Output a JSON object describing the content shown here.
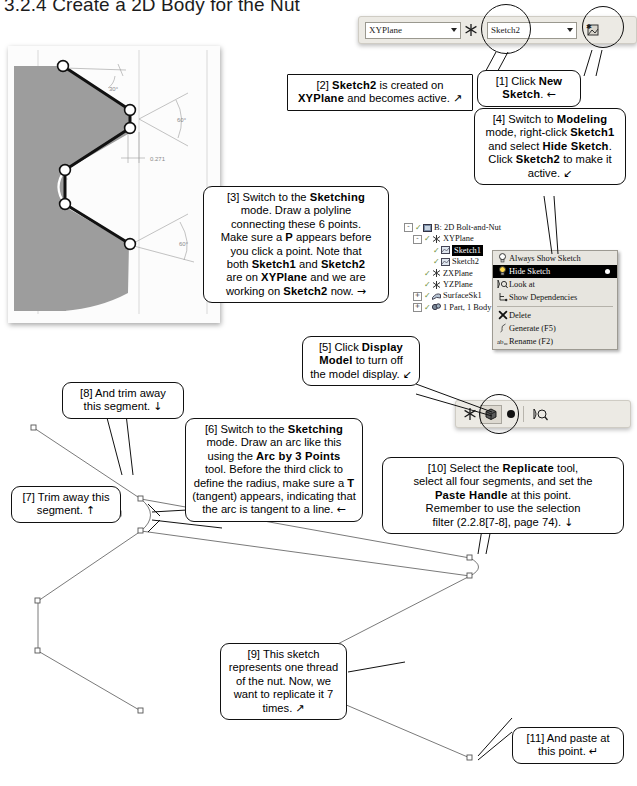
{
  "page": {
    "title": "3.2.4  Create a 2D Body for the Nut"
  },
  "toolbar_top": {
    "plane_value": "XYPlane",
    "plane_icon": "plane-axis-icon",
    "sketch_value": "Sketch2",
    "new_sketch_icon": "new-sketch-icon"
  },
  "toolbar_display": {
    "axis_icon": "plane-axis-icon",
    "display_model_icon": "display-model-icon",
    "look_at_icon": "look-at-icon"
  },
  "tree": {
    "items": [
      {
        "label": "B: 2D Bolt-and-Nut",
        "indent": 0,
        "expander": "-",
        "icon": "assembly-icon",
        "selected": false
      },
      {
        "label": "XYPlane",
        "indent": 1,
        "expander": "-",
        "icon": "plane-icon",
        "selected": false
      },
      {
        "label": "Sketch1",
        "indent": 2,
        "expander": "",
        "icon": "sketch-icon",
        "selected": true
      },
      {
        "label": "Sketch2",
        "indent": 2,
        "expander": "",
        "icon": "sketch-icon",
        "selected": false
      },
      {
        "label": "ZXPlane",
        "indent": 1,
        "expander": "",
        "icon": "plane-icon",
        "selected": false
      },
      {
        "label": "YZPlane",
        "indent": 1,
        "expander": "",
        "icon": "plane-icon",
        "selected": false
      },
      {
        "label": "SurfaceSk1",
        "indent": 1,
        "expander": "+",
        "icon": "surface-icon",
        "selected": false
      },
      {
        "label": "1 Part, 1 Body",
        "indent": 1,
        "expander": "+",
        "icon": "body-icon",
        "selected": false
      }
    ]
  },
  "context_menu": {
    "items": [
      {
        "label": "Always Show Sketch",
        "icon": "bulb-off-icon",
        "highlighted": false,
        "radio": false
      },
      {
        "label": "Hide Sketch",
        "icon": "bulb-on-icon",
        "highlighted": true,
        "radio": true
      },
      {
        "label": "Look at",
        "icon": "look-at-icon",
        "highlighted": false,
        "radio": false
      },
      {
        "label": "Show Dependencies",
        "icon": "dependencies-icon",
        "highlighted": false,
        "radio": false
      },
      {
        "label": "Delete",
        "icon": "delete-x-icon",
        "highlighted": false,
        "radio": false
      },
      {
        "label": "Generate (F5)",
        "icon": "generate-icon",
        "highlighted": false,
        "radio": false
      },
      {
        "label": "Rename (F2)",
        "icon": "rename-icon",
        "highlighted": false,
        "radio": false
      }
    ]
  },
  "cad_image": {
    "dimensions": [
      "30°",
      "60°",
      "0.271",
      "60°"
    ],
    "point_count": 6
  },
  "callouts": [
    {
      "id": "callout-1",
      "num": "[1]",
      "lines": [
        [
          {
            "t": "[1] Click ",
            "b": false
          },
          {
            "t": "New",
            "b": true
          }
        ],
        [
          {
            "t": "Sketch",
            "b": true
          },
          {
            "t": ". ",
            "b": false
          },
          {
            "t": "←",
            "b": false,
            "arrow": true
          }
        ]
      ]
    },
    {
      "id": "callout-2",
      "num": "[2]",
      "lines": [
        [
          {
            "t": "[2] ",
            "b": false
          },
          {
            "t": "Sketch2",
            "b": true
          },
          {
            "t": " is created on",
            "b": false
          }
        ],
        [
          {
            "t": "XYPlane",
            "b": true
          },
          {
            "t": " and becomes active. ",
            "b": false
          },
          {
            "t": "↗",
            "b": false,
            "arrow": true
          }
        ]
      ]
    },
    {
      "id": "callout-3",
      "num": "[3]",
      "lines": [
        [
          {
            "t": "[3] Switch to the ",
            "b": false
          },
          {
            "t": "Sketching",
            "b": true
          }
        ],
        [
          {
            "t": "mode.  Draw a polyline",
            "b": false
          }
        ],
        [
          {
            "t": "connecting these 6 points.",
            "b": false
          }
        ],
        [
          {
            "t": "Make sure a ",
            "b": false
          },
          {
            "t": "P",
            "b": true
          },
          {
            "t": " appears before",
            "b": false
          }
        ],
        [
          {
            "t": "you click a point.  Note that",
            "b": false
          }
        ],
        [
          {
            "t": "both ",
            "b": false
          },
          {
            "t": "Sketch1",
            "b": true
          },
          {
            "t": " and ",
            "b": false
          },
          {
            "t": "Sketch2",
            "b": true
          }
        ],
        [
          {
            "t": "are on ",
            "b": false
          },
          {
            "t": "XYPlane",
            "b": true
          },
          {
            "t": " and we are",
            "b": false
          }
        ],
        [
          {
            "t": "working on ",
            "b": false
          },
          {
            "t": "Sketch2",
            "b": true
          },
          {
            "t": " now. ",
            "b": false
          },
          {
            "t": "→",
            "b": false,
            "arrow": true
          }
        ]
      ]
    },
    {
      "id": "callout-4",
      "num": "[4]",
      "lines": [
        [
          {
            "t": "[4] Switch to ",
            "b": false
          },
          {
            "t": "Modeling",
            "b": true
          }
        ],
        [
          {
            "t": "mode, right-click ",
            "b": false
          },
          {
            "t": "Sketch1",
            "b": true
          }
        ],
        [
          {
            "t": "and select ",
            "b": false
          },
          {
            "t": "Hide Sketch",
            "b": true
          },
          {
            "t": ".",
            "b": false
          }
        ],
        [
          {
            "t": "Click ",
            "b": false
          },
          {
            "t": "Sketch2",
            "b": true
          },
          {
            "t": " to make it",
            "b": false
          }
        ],
        [
          {
            "t": "active. ",
            "b": false
          },
          {
            "t": "↙",
            "b": false,
            "arrow": true
          }
        ]
      ]
    },
    {
      "id": "callout-5",
      "num": "[5]",
      "lines": [
        [
          {
            "t": "[5] Click ",
            "b": false
          },
          {
            "t": "Display",
            "b": true
          }
        ],
        [
          {
            "t": "Model",
            "b": true
          },
          {
            "t": " to turn off",
            "b": false
          }
        ],
        [
          {
            "t": "the model display. ",
            "b": false
          },
          {
            "t": "↙",
            "b": false,
            "arrow": true
          }
        ]
      ]
    },
    {
      "id": "callout-6",
      "num": "[6]",
      "lines": [
        [
          {
            "t": "[6] Switch to the ",
            "b": false
          },
          {
            "t": "Sketching",
            "b": true
          }
        ],
        [
          {
            "t": "mode.  Draw an arc like this",
            "b": false
          }
        ],
        [
          {
            "t": "using the ",
            "b": false
          },
          {
            "t": "Arc by 3 Points",
            "b": true
          }
        ],
        [
          {
            "t": "tool.  Before the third click to",
            "b": false
          }
        ],
        [
          {
            "t": "define the radius, make sure a ",
            "b": false
          },
          {
            "t": "T",
            "b": true
          }
        ],
        [
          {
            "t": "(tangent) appears, indicating that",
            "b": false
          }
        ],
        [
          {
            "t": "the arc is tangent to a line. ",
            "b": false
          },
          {
            "t": "←",
            "b": false,
            "arrow": true
          }
        ]
      ]
    },
    {
      "id": "callout-7",
      "num": "[7]",
      "lines": [
        [
          {
            "t": "[7] Trim away this",
            "b": false
          }
        ],
        [
          {
            "t": "segment. ",
            "b": false
          },
          {
            "t": "↑",
            "b": false,
            "arrow": true
          }
        ]
      ]
    },
    {
      "id": "callout-8",
      "num": "[8]",
      "lines": [
        [
          {
            "t": "[8] And trim away",
            "b": false
          }
        ],
        [
          {
            "t": "this segment. ",
            "b": false
          },
          {
            "t": "↓",
            "b": false,
            "arrow": true
          }
        ]
      ]
    },
    {
      "id": "callout-9",
      "num": "[9]",
      "lines": [
        [
          {
            "t": "[9] This sketch",
            "b": false
          }
        ],
        [
          {
            "t": "represents one thread",
            "b": false
          }
        ],
        [
          {
            "t": "of the nut.  Now, we",
            "b": false
          }
        ],
        [
          {
            "t": "want to replicate it 7",
            "b": false
          }
        ],
        [
          {
            "t": "times. ",
            "b": false
          },
          {
            "t": "↗",
            "b": false,
            "arrow": true
          }
        ]
      ]
    },
    {
      "id": "callout-10",
      "num": "[10]",
      "lines": [
        [
          {
            "t": "[10] Select the ",
            "b": false
          },
          {
            "t": "Replicate",
            "b": true
          },
          {
            "t": " tool,",
            "b": false
          }
        ],
        [
          {
            "t": "select all four segments, and set the",
            "b": false
          }
        ],
        [
          {
            "t": "Paste Handle",
            "b": true
          },
          {
            "t": " at this point.",
            "b": false
          }
        ],
        [
          {
            "t": "Remember to use the selection",
            "b": false
          }
        ],
        [
          {
            "t": "filter (2.2.8[7-8], page 74). ",
            "b": false
          },
          {
            "t": "↓",
            "b": false,
            "arrow": true
          }
        ]
      ]
    },
    {
      "id": "callout-11",
      "num": "[11]",
      "lines": [
        [
          {
            "t": "[11] And paste at",
            "b": false
          }
        ],
        [
          {
            "t": "this point. ",
            "b": false
          },
          {
            "t": "↵",
            "b": false,
            "arrow": true
          }
        ]
      ]
    }
  ]
}
